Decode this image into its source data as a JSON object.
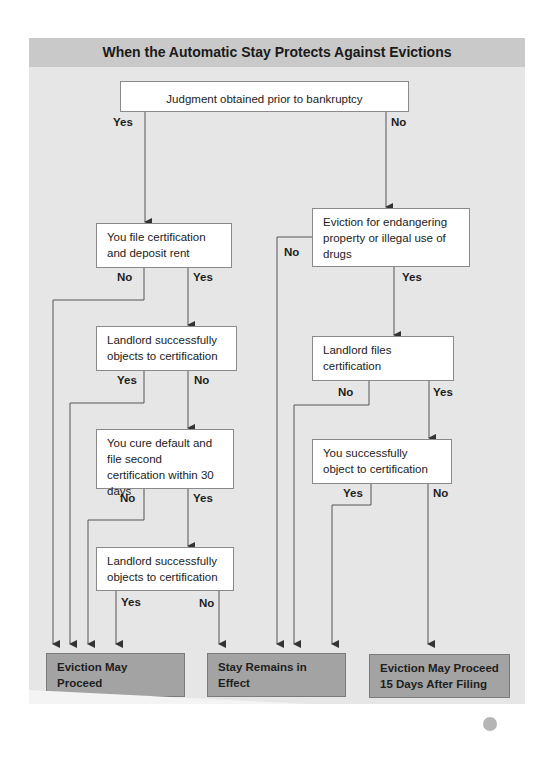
{
  "title": "When the Automatic Stay Protects Against Evictions",
  "nodes": {
    "judgment": "Judgment obtained prior to bankruptcy",
    "file_cert": "You file certification and deposit rent",
    "landlord_objects_1": "Landlord successfully objects to certification",
    "cure_default": "You cure default and file second certification within 30 days",
    "landlord_objects_2": "Landlord successfully objects to certification",
    "endangering": "Eviction for endangering property or illegal use of drugs",
    "landlord_files": "Landlord files certification",
    "you_object": "You successfully object to certification"
  },
  "outcomes": {
    "eviction_may_proceed": "Eviction May Proceed",
    "stay_remains": "Stay Remains in Effect",
    "eviction_15_days_line1": "Eviction May Proceed",
    "eviction_15_days_line2": "15 Days After Filing"
  },
  "labels": {
    "yes": "Yes",
    "no": "No"
  },
  "colors": {
    "panel_bg": "#e6e6e6",
    "header_bg": "#c9c9c9",
    "outcome_bg": "#a3a3a3",
    "line": "#555555"
  }
}
